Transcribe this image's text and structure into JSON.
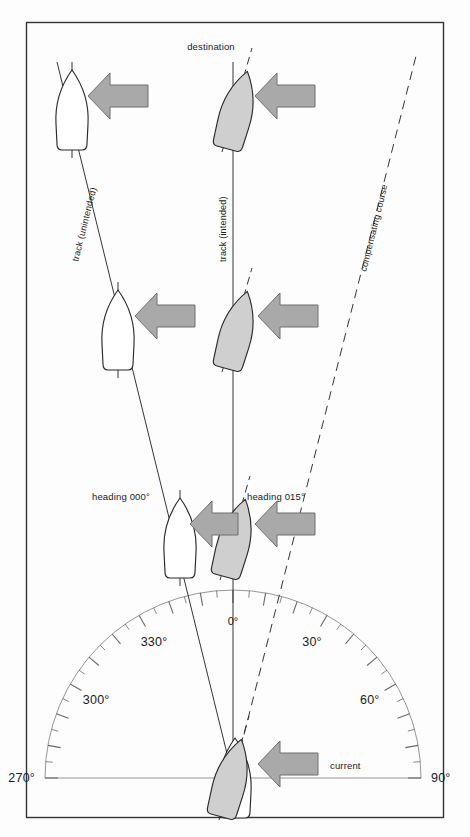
{
  "figure": {
    "type": "navigation-diagram",
    "frame_color": "#333333",
    "background_color": "#fdfdfd"
  },
  "labels": {
    "destination": "destination",
    "track_unintended": "track (unintended)",
    "track_intended": "track (intended)",
    "compensating_course": "compensating course",
    "heading_000": "heading 000°",
    "heading_015": "heading 015°",
    "current": "current",
    "zero_degrees": "0°"
  },
  "compass": {
    "center_x": 233,
    "center_y": 778,
    "radius": 188,
    "ticks_every_deg": 5,
    "major_every_deg": 10,
    "range_start_deg": 270,
    "range_end_deg": 90,
    "labels": [
      {
        "value": "270°",
        "deg": 270
      },
      {
        "value": "300°",
        "deg": 300
      },
      {
        "value": "330°",
        "deg": 330
      },
      {
        "value": "0°",
        "deg": 0
      },
      {
        "value": "30°",
        "deg": 30
      },
      {
        "value": "60°",
        "deg": 60
      },
      {
        "value": "90°",
        "deg": 90
      }
    ]
  },
  "colors": {
    "line": "#2a2a2a",
    "arrow_fill": "#a9a9a9",
    "arrow_stroke": "#5a5a5a",
    "boat_shaded_fill": "#cfcfcf",
    "boat_white_fill": "#ffffff",
    "boat_stroke": "#2a2a2a",
    "compass_line": "#6a6a6a",
    "text": "#1a1a1a"
  },
  "vessels": [
    {
      "id": "white-top",
      "column": "unintended",
      "cx": 72,
      "cy": 110,
      "heading_deg": 0,
      "fill": "white"
    },
    {
      "id": "white-mid",
      "column": "unintended",
      "cx": 118,
      "cy": 330,
      "heading_deg": 0,
      "fill": "white"
    },
    {
      "id": "white-low",
      "column": "unintended",
      "cx": 180,
      "cy": 538,
      "heading_deg": 0,
      "fill": "white"
    },
    {
      "id": "white-origin",
      "column": "origin",
      "cx": 233,
      "cy": 778,
      "heading_deg": 0,
      "fill": "white"
    },
    {
      "id": "gray-top",
      "column": "intended",
      "cx": 237,
      "cy": 110,
      "heading_deg": 15,
      "fill": "shaded"
    },
    {
      "id": "gray-mid",
      "column": "intended",
      "cx": 237,
      "cy": 330,
      "heading_deg": 15,
      "fill": "shaded"
    },
    {
      "id": "gray-low",
      "column": "intended",
      "cx": 235,
      "cy": 538,
      "heading_deg": 15,
      "fill": "shaded"
    },
    {
      "id": "gray-origin",
      "column": "origin",
      "cx": 233,
      "cy": 778,
      "heading_deg": 15,
      "fill": "shaded"
    }
  ],
  "current_arrows": [
    {
      "id": "arrow-row1-left",
      "x": 88,
      "y": 96,
      "length": 60,
      "size": "large"
    },
    {
      "id": "arrow-row1-right",
      "x": 255,
      "y": 96,
      "length": 60,
      "size": "large"
    },
    {
      "id": "arrow-row2-left",
      "x": 135,
      "y": 316,
      "length": 60,
      "size": "large"
    },
    {
      "id": "arrow-row2-right",
      "x": 258,
      "y": 316,
      "length": 60,
      "size": "large"
    },
    {
      "id": "arrow-row3-left",
      "x": 190,
      "y": 524,
      "length": 48,
      "size": "small"
    },
    {
      "id": "arrow-row3-right",
      "x": 255,
      "y": 524,
      "length": 60,
      "size": "large"
    },
    {
      "id": "arrow-current",
      "x": 258,
      "y": 764,
      "length": 62,
      "size": "large"
    }
  ],
  "lines": [
    {
      "id": "track-intended",
      "style": "solid",
      "from_x": 233,
      "from_y": 778,
      "to_x": 233,
      "to_y": 62
    },
    {
      "id": "track-unintended",
      "style": "solid",
      "from_x": 233,
      "from_y": 778,
      "to_x": 57,
      "to_y": 62
    },
    {
      "id": "compensating-course",
      "style": "dashed",
      "from_x": 233,
      "from_y": 778,
      "to_x": 417,
      "to_y": 52
    },
    {
      "id": "destination-pointer",
      "style": "dashed",
      "from_x": 233,
      "from_y": 778,
      "to_x": 233,
      "to_y": 52
    }
  ]
}
